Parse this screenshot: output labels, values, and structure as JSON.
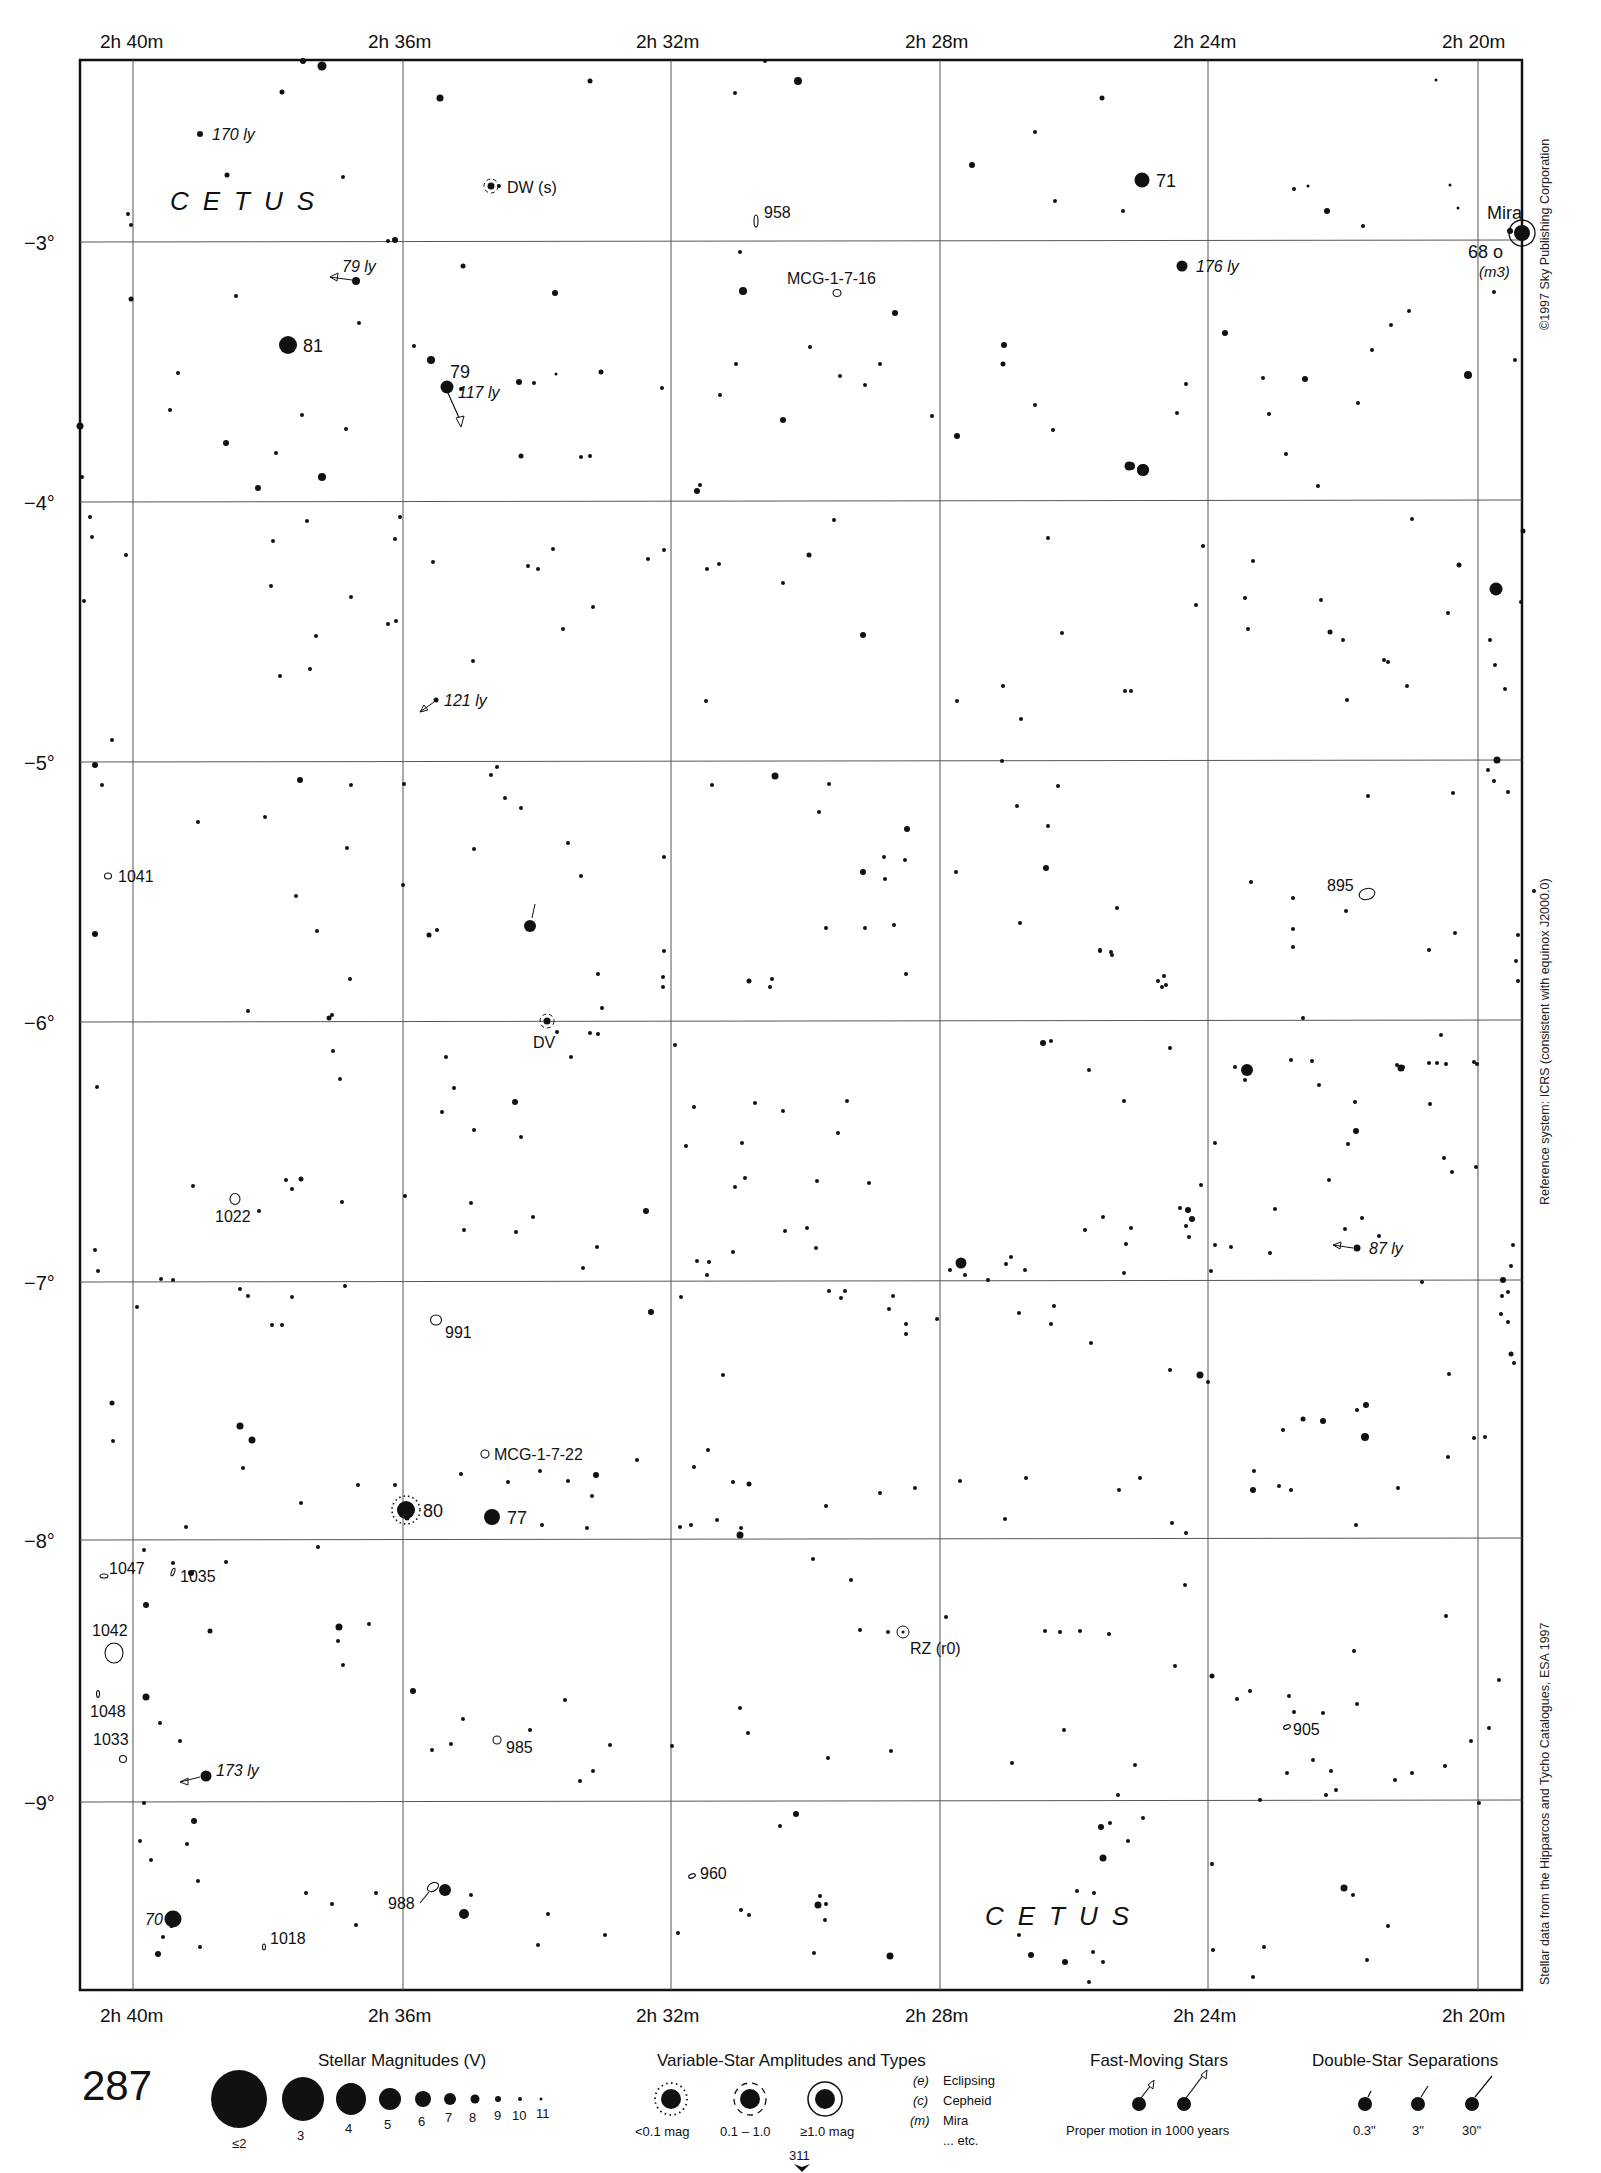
{
  "chart_data": {
    "type": "scatter",
    "page_number": "287",
    "adjacent_chart": "311",
    "constellation_labels": [
      {
        "text": "CETUS",
        "x": 170,
        "y": 210
      },
      {
        "text": "CETUS",
        "x": 985,
        "y": 1925
      }
    ],
    "ra_axis": {
      "labels": [
        "2h 40m",
        "2h 36m",
        "2h 32m",
        "2h 28m",
        "2h 24m",
        "2h 20m"
      ],
      "x_positions": [
        133,
        403,
        671,
        940,
        1208,
        1478
      ]
    },
    "dec_axis": {
      "labels": [
        "−3°",
        "−4°",
        "−5°",
        "−6°",
        "−7°",
        "−8°",
        "−9°"
      ],
      "y_positions": [
        242,
        502,
        762,
        1022,
        1282,
        1540,
        1802
      ]
    },
    "frame": {
      "left": 80,
      "top": 60,
      "right": 1522,
      "bottom": 1990
    },
    "named_stars": [
      {
        "label": "81",
        "x": 288,
        "y": 345,
        "mag": 4.5
      },
      {
        "label": "79",
        "x": 447,
        "y": 387,
        "mag": 5.5,
        "note": "117 ly"
      },
      {
        "label": "71",
        "x": 1142,
        "y": 180,
        "mag": 5
      },
      {
        "label": "Mira",
        "x": 1522,
        "y": 233,
        "mag": 3,
        "variable": "≥1.0 mag"
      },
      {
        "label": "68 o",
        "x": 1504,
        "y": 252,
        "mag": 9,
        "note": "(m3)"
      },
      {
        "label": "80",
        "x": 406,
        "y": 1510,
        "mag": 4.5,
        "variable": "<0.1 mag"
      },
      {
        "label": "77",
        "x": 492,
        "y": 1517,
        "mag": 5
      }
    ],
    "variable_stars": [
      {
        "label": "DW (s)",
        "x": 491,
        "y": 186
      },
      {
        "label": "DV",
        "x": 547,
        "y": 1021
      },
      {
        "label": "RZ (r0)",
        "x": 903,
        "y": 1632
      }
    ],
    "distance_labels": [
      {
        "text": "170 ly",
        "x": 200,
        "y": 134
      },
      {
        "text": "79 ly",
        "x": 356,
        "y": 281
      },
      {
        "text": "117 ly",
        "x": 453,
        "y": 392
      },
      {
        "text": "176 ly",
        "x": 1182,
        "y": 266
      },
      {
        "text": "121 ly",
        "x": 436,
        "y": 700
      },
      {
        "text": "87 ly",
        "x": 1357,
        "y": 1248
      },
      {
        "text": "173 ly",
        "x": 206,
        "y": 1776
      },
      {
        "text": "70 ly",
        "x": 128,
        "y": 1919
      }
    ],
    "galaxies": [
      {
        "label": "958",
        "x": 756,
        "y": 221
      },
      {
        "label": "MCG-1-7-16",
        "x": 837,
        "y": 293
      },
      {
        "label": "895",
        "x": 1367,
        "y": 894
      },
      {
        "label": "1041",
        "x": 108,
        "y": 876
      },
      {
        "label": "1022",
        "x": 235,
        "y": 1199
      },
      {
        "label": "991",
        "x": 436,
        "y": 1320
      },
      {
        "label": "MCG-1-7-22",
        "x": 485,
        "y": 1454
      },
      {
        "label": "1047",
        "x": 104,
        "y": 1576
      },
      {
        "label": "1035",
        "x": 173,
        "y": 1572
      },
      {
        "label": "1042",
        "x": 114,
        "y": 1653
      },
      {
        "label": "1048",
        "x": 98,
        "y": 1678
      },
      {
        "label": "1033",
        "x": 123,
        "y": 1739
      },
      {
        "label": "985",
        "x": 497,
        "y": 1740
      },
      {
        "label": "905",
        "x": 1287,
        "y": 1727
      },
      {
        "label": "960",
        "x": 692,
        "y": 1876
      },
      {
        "label": "988",
        "x": 432,
        "y": 1891
      },
      {
        "label": "1018",
        "x": 264,
        "y": 1944
      }
    ]
  },
  "side_notes": {
    "copyright": "©1997 Sky Publishing Corporation",
    "reference": "Reference system: ICRS (consistent with equinox J2000.0)",
    "source": "Stellar data from the Hipparcos and Tycho Catalogues, ESA 1997"
  },
  "legend": {
    "page_number": "287",
    "magnitudes": {
      "title": "Stellar Magnitudes (V)",
      "labels": [
        "≤2",
        "3",
        "4",
        "5",
        "6",
        "7",
        "8",
        "9",
        "10",
        "11"
      ]
    },
    "variables": {
      "title": "Variable-Star Amplitudes and Types",
      "amplitudes": [
        "<0.1 mag",
        "0.1 – 1.0",
        "≥1.0 mag"
      ],
      "types": [
        {
          "code": "(e)",
          "name": "Eclipsing"
        },
        {
          "code": "(c)",
          "name": "Cepheid"
        },
        {
          "code": "(m)",
          "name": "Mira"
        },
        {
          "code": "",
          "name": "... etc."
        }
      ],
      "next_chart": "311"
    },
    "fast_moving": {
      "title": "Fast-Moving Stars",
      "caption": "Proper motion in 1000 years"
    },
    "doubles": {
      "title": "Double-Star Separations",
      "labels": [
        "0.3\"",
        "3\"",
        "30\""
      ]
    }
  },
  "colors": {
    "ink": "#111111",
    "grid": "#444444",
    "paper": "#ffffff"
  }
}
